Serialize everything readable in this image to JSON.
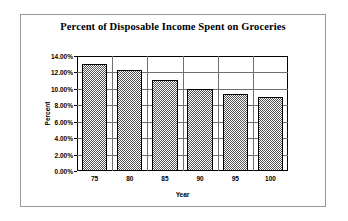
{
  "chart_data": {
    "type": "bar",
    "title": "Percent of Disposable Income Spent on Groceries",
    "xlabel": "Year",
    "ylabel": "Percent",
    "categories": [
      "75",
      "80",
      "85",
      "90",
      "95",
      "100"
    ],
    "values": [
      13.0,
      12.25,
      11.1,
      10.0,
      9.4,
      8.95
    ],
    "ylim": [
      0,
      14
    ],
    "ytick_labels": [
      "14.00%",
      "12.00%",
      "10.00%",
      "8.00%",
      "6.00%",
      "4.00%",
      "2.00%",
      "0.00%"
    ],
    "ytick_values": [
      14,
      12,
      10,
      8,
      6,
      4,
      2,
      0
    ],
    "grid": true,
    "legend": "none",
    "bar_fill": "#555555",
    "bar_border": "#000000",
    "gridline_color": "#6f6f6f",
    "frame_color": "#9a9a9a",
    "background": "#ffffff"
  }
}
